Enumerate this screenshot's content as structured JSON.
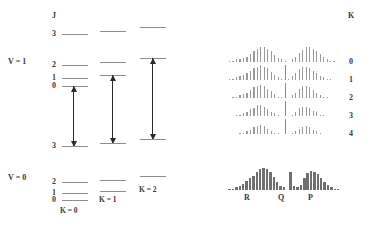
{
  "figure": {
    "title_axis_j": "J",
    "title_axis_k": "K",
    "vib_upper": "V = 1",
    "vib_lower": "V = 0"
  },
  "j_labels_upper": [
    "3",
    "2",
    "1",
    "0"
  ],
  "j_labels_lower": [
    "2",
    "1",
    "0"
  ],
  "j_label_bottom_upper": "3",
  "k_stack_labels": [
    "K = 0",
    "K = 1",
    "K = 2"
  ],
  "k_right_labels": [
    "0",
    "1",
    "2",
    "3",
    "4"
  ],
  "branch_labels": [
    "R",
    "Q",
    "P"
  ],
  "colors": {
    "level_line": "#8d8d8d",
    "arrow": "#2a2a2a",
    "spectrum_line": "#9a9a9a",
    "band_bar": "#6f6f6f",
    "text": "#3a3a3a",
    "background": "#ffffff"
  },
  "chart_data": {
    "type": "bar",
    "xlabel": "",
    "ylabel": "",
    "energy_levels": {
      "V = 1": {
        "K = 0": [
          {
            "J": "3",
            "y": 34
          },
          {
            "J": "2",
            "y": 65
          },
          {
            "J": "1",
            "y": 78
          },
          {
            "J": "0",
            "y": 86
          }
        ],
        "K = 1": [
          {
            "J": "3",
            "y": 31
          },
          {
            "J": "2",
            "y": 62
          },
          {
            "J": "1",
            "y": 75
          }
        ],
        "K = 2": [
          {
            "J": "3",
            "y": 27
          },
          {
            "J": "2",
            "y": 58
          }
        ]
      },
      "V = 0": {
        "K = 0": [
          {
            "J": "3",
            "y": 146
          },
          {
            "J": "2",
            "y": 182
          },
          {
            "J": "1",
            "y": 193
          },
          {
            "J": "0",
            "y": 200
          }
        ],
        "K = 1": [
          {
            "J": "3",
            "y": 143
          },
          {
            "J": "2",
            "y": 180
          },
          {
            "J": "1",
            "y": 191
          }
        ],
        "K = 2": [
          {
            "J": "3",
            "y": 139
          },
          {
            "J": "2",
            "y": 176
          }
        ]
      }
    },
    "transitions": [
      {
        "stack": "K = 0",
        "x": 73,
        "top": 86,
        "bottom": 146,
        "style": "both"
      },
      {
        "stack": "K = 1",
        "x": 112,
        "top": 75,
        "bottom": 143,
        "style": "both"
      },
      {
        "stack": "K = 2",
        "x": 152,
        "top": 58,
        "bottom": 139,
        "style": "both"
      }
    ],
    "spectra": [
      {
        "K": "0",
        "y": 62,
        "heights": [
          1,
          1,
          2,
          2,
          3,
          4,
          6,
          8,
          10,
          11,
          11,
          10,
          8,
          5,
          3,
          2,
          1,
          0,
          2,
          4,
          7,
          9,
          11,
          11,
          10,
          8,
          6,
          4,
          2,
          1,
          1
        ]
      },
      {
        "K": "1",
        "y": 80,
        "heights": [
          1,
          1,
          2,
          3,
          4,
          5,
          7,
          9,
          10,
          11,
          10,
          9,
          6,
          4,
          2,
          1,
          12,
          1,
          3,
          5,
          8,
          10,
          10,
          9,
          7,
          5,
          3,
          2,
          1,
          1,
          0
        ]
      },
      {
        "K": "2",
        "y": 98,
        "heights": [
          0,
          1,
          1,
          2,
          3,
          4,
          6,
          8,
          9,
          10,
          9,
          7,
          5,
          3,
          1,
          1,
          12,
          0,
          2,
          4,
          7,
          9,
          9,
          8,
          6,
          4,
          2,
          1,
          1,
          0,
          0
        ]
      },
      {
        "K": "3",
        "y": 116,
        "heights": [
          0,
          0,
          1,
          1,
          2,
          3,
          5,
          6,
          8,
          8,
          7,
          5,
          3,
          2,
          1,
          0,
          12,
          0,
          1,
          3,
          6,
          7,
          7,
          6,
          4,
          3,
          1,
          1,
          0,
          0,
          0
        ]
      },
      {
        "K": "4",
        "y": 134,
        "heights": [
          0,
          0,
          0,
          1,
          1,
          2,
          3,
          5,
          6,
          7,
          6,
          4,
          2,
          1,
          1,
          0,
          12,
          0,
          1,
          2,
          4,
          5,
          6,
          5,
          3,
          2,
          1,
          0,
          0,
          0,
          0
        ]
      }
    ],
    "summed_band": {
      "y": 190,
      "heights": [
        1,
        1,
        2,
        3,
        5,
        7,
        9,
        11,
        14,
        16,
        17,
        16,
        14,
        10,
        6,
        3,
        2,
        0,
        14,
        3,
        2,
        4,
        9,
        13,
        15,
        14,
        12,
        9,
        6,
        4,
        2,
        1,
        1
      ],
      "branches": [
        {
          "label": "R",
          "x": 246
        },
        {
          "label": "Q",
          "x": 280
        },
        {
          "label": "P",
          "x": 310
        }
      ]
    }
  }
}
